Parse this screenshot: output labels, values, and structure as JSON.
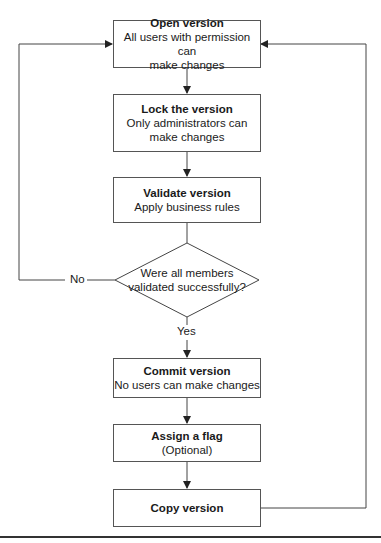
{
  "diagram": {
    "type": "flowchart",
    "nodes": [
      {
        "id": "open",
        "title": "Open version",
        "subtitle_lines": [
          "All users with permission can",
          "make changes"
        ]
      },
      {
        "id": "lock",
        "title": "Lock the version",
        "subtitle_lines": [
          "Only administrators can",
          "make changes"
        ]
      },
      {
        "id": "validate",
        "title": "Validate version",
        "subtitle_lines": [
          "Apply business rules"
        ]
      },
      {
        "id": "decision",
        "shape": "diamond",
        "lines": [
          "Were all members",
          "validated successfully?"
        ]
      },
      {
        "id": "commit",
        "title": "Commit version",
        "subtitle_lines": [
          "No users can make changes"
        ]
      },
      {
        "id": "flag",
        "title": "Assign a flag",
        "subtitle_lines": [
          "(Optional)"
        ]
      },
      {
        "id": "copy",
        "title": "Copy version",
        "subtitle_lines": []
      }
    ],
    "edges": [
      {
        "from": "open",
        "to": "lock"
      },
      {
        "from": "lock",
        "to": "validate"
      },
      {
        "from": "validate",
        "to": "decision"
      },
      {
        "from": "decision",
        "to": "open",
        "label": "No"
      },
      {
        "from": "decision",
        "to": "commit",
        "label": "Yes"
      },
      {
        "from": "commit",
        "to": "flag"
      },
      {
        "from": "flag",
        "to": "copy"
      },
      {
        "from": "copy",
        "to": "open"
      }
    ],
    "labels": {
      "no": "No",
      "yes": "Yes"
    },
    "colors": {
      "line": "#444444",
      "box_border": "#555555",
      "background": "#ffffff"
    }
  }
}
